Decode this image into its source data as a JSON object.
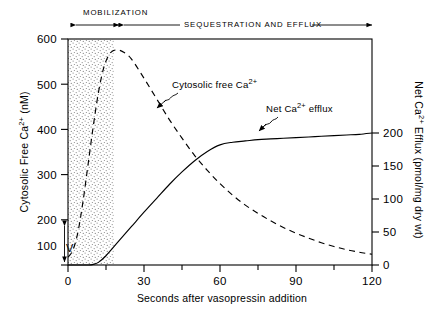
{
  "figure": {
    "phases": [
      {
        "name": "mobilization",
        "label": "MOBILIZATION",
        "start_seconds": 0,
        "end_seconds": 18
      },
      {
        "name": "sequestration-efflux",
        "label": "SEQUESTRATION AND EFFLUX",
        "start_seconds": 18,
        "end_seconds": 120
      }
    ],
    "marker": {
      "label": "V",
      "meaning": "vasopressin addition",
      "at_seconds": 0
    }
  },
  "chart_data": {
    "type": "line",
    "title": "",
    "xlabel": "Seconds after vasopressin addition",
    "xlim": [
      -5,
      120
    ],
    "xticks": [
      0,
      30,
      60,
      90,
      120
    ],
    "xtick_labels": [
      "0",
      "30",
      "60",
      "90",
      "120"
    ],
    "xminor_ticks": [
      15,
      45,
      75,
      105
    ],
    "grid": false,
    "legend": "inline-annotations",
    "axes": [
      {
        "id": "left",
        "label": "Cytosolic Free Ca",
        "label_sup": "2+",
        "label_units": "(nM)",
        "label_full": "Cytosolic Free Ca2+ (nM)",
        "ylim": [
          60,
          600
        ],
        "yticks": [
          100,
          200,
          300,
          400,
          500,
          600
        ],
        "ytick_labels": [
          "100",
          "200",
          "300",
          "400",
          "500",
          "600"
        ]
      },
      {
        "id": "right",
        "label": "Net Ca",
        "label_sup": "2+",
        "label_units": "Efflux (pmol/mg dry wt)",
        "label_full": "Net Ca2+ Efflux (pmol/mg dry wt)",
        "ylim": [
          -30,
          290
        ],
        "yticks": [
          0,
          50,
          100,
          150,
          200
        ],
        "ytick_labels": [
          "0",
          "50",
          "100",
          "150",
          "200"
        ]
      }
    ],
    "shaded_region": {
      "name": "mobilization-band",
      "x_start": 0,
      "x_end": 18,
      "style": "stippled"
    },
    "series": [
      {
        "name": "Cytosolic free Ca2+",
        "annotation": "Cytosolic free Ca",
        "annotation_sup": "2+",
        "axis": "left",
        "style": "dashed",
        "units": "nM",
        "x": [
          0,
          2,
          4,
          6,
          8,
          10,
          12,
          14,
          16,
          18,
          20,
          22,
          25,
          30,
          35,
          40,
          45,
          50,
          55,
          60,
          65,
          70,
          75,
          80,
          85,
          90,
          95,
          100,
          105,
          110,
          115,
          120
        ],
        "y": [
          72,
          90,
          135,
          210,
          300,
          390,
          470,
          528,
          560,
          572,
          573,
          568,
          552,
          505,
          455,
          405,
          360,
          318,
          282,
          250,
          222,
          198,
          178,
          160,
          144,
          130,
          118,
          107,
          98,
          90,
          84,
          79
        ]
      },
      {
        "name": "Net Ca2+ efflux",
        "annotation": "Net Ca",
        "annotation_sup": "2+",
        "annotation_tail": "efflux",
        "axis": "right",
        "style": "solid",
        "units": "pmol/mg dry wt",
        "x": [
          0,
          4,
          8,
          10,
          12,
          15,
          20,
          25,
          30,
          35,
          40,
          45,
          50,
          55,
          60,
          65,
          70,
          75,
          80,
          85,
          90,
          95,
          100,
          105,
          110,
          115,
          120
        ],
        "y": [
          0,
          0,
          0,
          1,
          4,
          14,
          36,
          58,
          80,
          101,
          122,
          141,
          158,
          172,
          182,
          186,
          188,
          190,
          191,
          192,
          193,
          194,
          195,
          196,
          197,
          198,
          200
        ]
      }
    ]
  }
}
